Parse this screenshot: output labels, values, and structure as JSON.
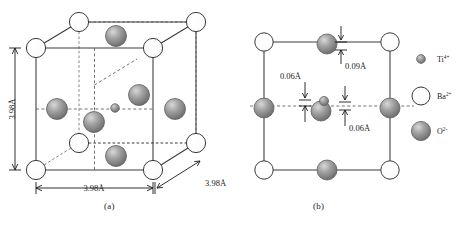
{
  "figure": {
    "title_absent": true,
    "panels": [
      {
        "id": "a",
        "caption": "(a)",
        "description": "Cubic BaTiO3 perovskite unit cell",
        "dimensions": [
          {
            "name": "height",
            "value": "3.98Å"
          },
          {
            "name": "width",
            "value": "3.98Å"
          },
          {
            "name": "depth",
            "value": "3.98Å"
          }
        ]
      },
      {
        "id": "b",
        "caption": "(b)",
        "description": "Tetragonal BaTiO3 projection with ion displacements",
        "displacements": [
          {
            "name": "top-oxygen-shift",
            "value": "0.09Å"
          },
          {
            "name": "side-oxygen-shift",
            "value": "0.06Å"
          },
          {
            "name": "center-oxygen-shift",
            "value": "0.06Å"
          }
        ]
      }
    ],
    "legend": {
      "items": [
        {
          "symbol": "Ti",
          "charge": "4+",
          "label": "Ti",
          "sup": "4+",
          "marker": "small-gray-sphere",
          "color": "#8a8a8a"
        },
        {
          "symbol": "Ba",
          "charge": "2+",
          "label": "Ba",
          "sup": "2+",
          "marker": "large-white-sphere",
          "color": "#ffffff"
        },
        {
          "symbol": "O",
          "charge": "2-",
          "label": "O",
          "sup": "2-",
          "marker": "large-gray-sphere",
          "color": "#8a8a8a"
        }
      ]
    },
    "colors": {
      "line": "#3a3a3a",
      "dashed": "#6e6e6e",
      "sphere_gray": "#8a8a8a",
      "sphere_white": "#ffffff",
      "text": "#1a1a1a",
      "background": "#ffffff"
    }
  }
}
